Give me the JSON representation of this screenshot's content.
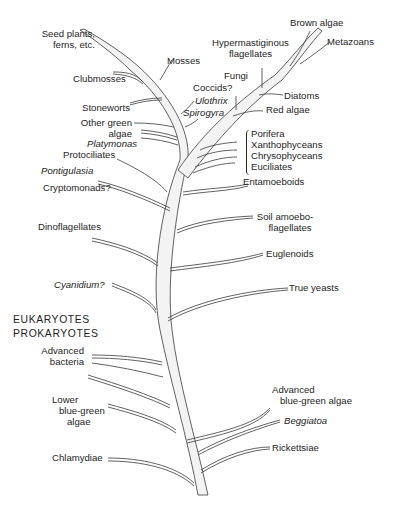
{
  "diagram": {
    "type": "phylogenetic-tree",
    "trunk": "single tapering trunk from bottom center curving up-left, with a second major branch curving up-right",
    "divider_labels": {
      "eukaryotes": "EUKARYOTES",
      "prokaryotes": "PROKARYOTES"
    },
    "left_labels": {
      "seed_plants_1": "Seed plants,",
      "seed_plants_2": "ferns, etc.",
      "clubmosses": "Clubmosses",
      "mosses": "Mosses",
      "stoneworts": "Stoneworts",
      "other_green_1": "Other green",
      "other_green_2": "algae",
      "platymonas": "Platymonas",
      "protociliates": "Protociliates",
      "pontigulasia": "Pontigulasia",
      "cryptomonads": "Cryptomonads?",
      "dinoflagellates": "Dinoflagellates",
      "cyanidium": "Cyanidium?",
      "advanced_bacteria_1": "Advanced",
      "advanced_bacteria_2": "bacteria",
      "lower_bga_1": "Lower",
      "lower_bga_2": "blue-green",
      "lower_bga_3": "algae",
      "chlamydiae": "Chlamydiae"
    },
    "center_labels": {
      "coccids": "Coccids?",
      "ulothrix": "Ulothrix",
      "spirogyra": "Spirogyra",
      "fungi": "Fungi",
      "hypermastiginous_1": "Hypermastiginous",
      "hypermastiginous_2": "flagellates"
    },
    "right_labels": {
      "brown_algae": "Brown algae",
      "metazoans": "Metazoans",
      "diatoms": "Diatoms",
      "red_algae": "Red algae",
      "bracket_group": [
        "Porifera",
        "Xanthophyceans",
        "Chrysophyceans",
        "Euciliates"
      ],
      "entamoeboids": "Entamoeboids",
      "soil_amoebo_1": "Soil amoebo-",
      "soil_amoebo_2": "flagellates",
      "euglenoids": "Euglenoids",
      "true_yeasts": "True yeasts",
      "advanced_bga_1": "Advanced",
      "advanced_bga_2": "blue-green algae",
      "beggiatoa": "Beggiatoa",
      "rickettsiae": "Rickettsiae"
    },
    "colors": {
      "line": "#333333",
      "branch_fill": "#f2f2f2",
      "background": "#ffffff"
    }
  }
}
